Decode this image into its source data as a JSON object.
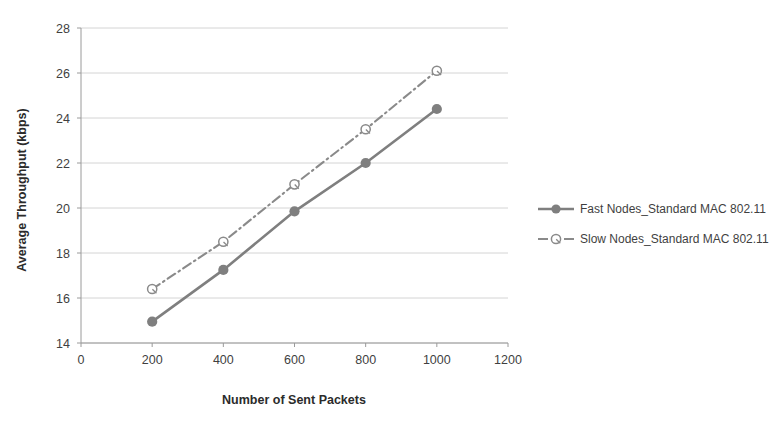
{
  "chart_data": {
    "type": "line",
    "title": "",
    "xlabel": "Number of Sent Packets",
    "ylabel": "Average Throughput (kbps)",
    "x": [
      200,
      400,
      600,
      800,
      1000
    ],
    "xlim": [
      0,
      1200
    ],
    "ylim": [
      14,
      28
    ],
    "xticks": [
      0,
      200,
      400,
      600,
      800,
      1000,
      1200
    ],
    "yticks": [
      14,
      16,
      18,
      20,
      22,
      24,
      26,
      28
    ],
    "xtick_labels": [
      "0",
      "200",
      "400",
      "600",
      "800",
      "1000",
      "1200"
    ],
    "ytick_labels": [
      "14",
      "16",
      "18",
      "20",
      "22",
      "24",
      "26",
      "28"
    ],
    "grid": "horizontal",
    "legend_position": "right",
    "series": [
      {
        "name": "Fast Nodes_Standard MAC 802.11",
        "values": [
          14.95,
          17.25,
          19.85,
          22.0,
          24.4
        ],
        "color": "#7f7f7f",
        "line_style": "solid",
        "marker": "filled-circle"
      },
      {
        "name": "Slow Nodes_Standard MAC 802.11",
        "values": [
          16.4,
          18.5,
          21.05,
          23.5,
          26.1
        ],
        "color": "#8a8a8a",
        "line_style": "dash-dot",
        "marker": "open-circle"
      }
    ]
  },
  "legend": {
    "entries": [
      {
        "label": "Fast Nodes_Standard MAC 802.11"
      },
      {
        "label": "Slow Nodes_Standard MAC 802.11"
      }
    ]
  },
  "colors": {
    "series_fast": "#7f7f7f",
    "series_slow": "#8a8a8a",
    "gridline": "#c9c9c9",
    "axis": "#9a9a9a",
    "text": "#3f3f3f",
    "background": "#ffffff"
  }
}
